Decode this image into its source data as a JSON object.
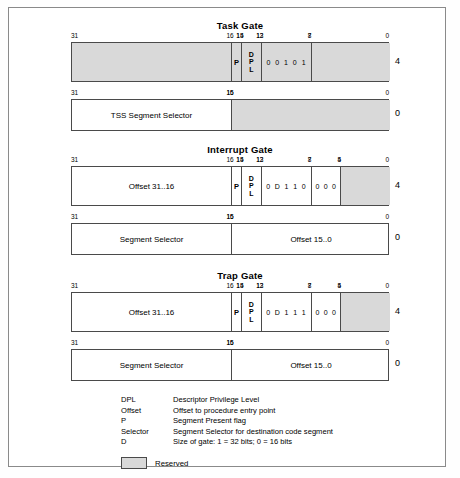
{
  "legend": {
    "rows": [
      {
        "key": "DPL",
        "desc": "Descriptor Privilege Level"
      },
      {
        "key": "Offset",
        "desc": "Offset to procedure entry point"
      },
      {
        "key": "P",
        "desc": "Segment Present flag"
      },
      {
        "key": "Selector",
        "desc": "Segment Selector for destination code segment"
      },
      {
        "key": "D",
        "desc": "Size of gate: 1 = 32 bits; 0 = 16 bits"
      }
    ],
    "reserved_label": "Reserved"
  },
  "colors": {
    "reserved_fill": "#d9d9d9",
    "box_border": "#4a4a4a",
    "page_border": "#8a8a8a",
    "background": "#ffffff"
  },
  "sections": [
    {
      "title": "Task Gate",
      "rows": [
        {
          "offset": "4",
          "ticks": [
            "31",
            "16",
            "15",
            "14",
            "13",
            "12",
            "8",
            "7",
            "0"
          ],
          "fields": [
            {
              "name": "reserved-high",
              "text": "",
              "reserved": true
            },
            {
              "name": "present-flag",
              "text": "P",
              "reserved": true
            },
            {
              "name": "dpl",
              "text": "DPL",
              "reserved": true
            },
            {
              "name": "type-bits",
              "bits": [
                "0",
                "0",
                "1",
                "0",
                "1"
              ],
              "reserved": true
            },
            {
              "name": "reserved-low",
              "text": "",
              "reserved": true
            }
          ]
        },
        {
          "offset": "0",
          "ticks": [
            "31",
            "16",
            "15",
            "0"
          ],
          "fields": [
            {
              "name": "tss-segment-selector",
              "text": "TSS Segment Selector",
              "reserved": false
            },
            {
              "name": "reserved-low",
              "text": "",
              "reserved": true
            }
          ]
        }
      ]
    },
    {
      "title": "Interrupt Gate",
      "rows": [
        {
          "offset": "4",
          "ticks": [
            "31",
            "16",
            "15",
            "14",
            "13",
            "12",
            "8",
            "7",
            "5",
            "4",
            "0"
          ],
          "fields": [
            {
              "name": "offset-high",
              "text": "Offset 31..16",
              "reserved": false
            },
            {
              "name": "present-flag",
              "text": "P",
              "reserved": false
            },
            {
              "name": "dpl",
              "text": "DPL",
              "reserved": false
            },
            {
              "name": "type-bits",
              "bits": [
                "0",
                "D",
                "1",
                "1",
                "0"
              ],
              "reserved": false
            },
            {
              "name": "zero-bits",
              "bits": [
                "0",
                "0",
                "0"
              ],
              "reserved": false
            },
            {
              "name": "reserved-low",
              "text": "",
              "reserved": true
            }
          ]
        },
        {
          "offset": "0",
          "ticks": [
            "31",
            "16",
            "15",
            "0"
          ],
          "fields": [
            {
              "name": "segment-selector",
              "text": "Segment Selector",
              "reserved": false
            },
            {
              "name": "offset-low",
              "text": "Offset 15..0",
              "reserved": false
            }
          ]
        }
      ]
    },
    {
      "title": "Trap Gate",
      "rows": [
        {
          "offset": "4",
          "ticks": [
            "31",
            "16",
            "15",
            "14",
            "13",
            "12",
            "8",
            "7",
            "5",
            "4",
            "0"
          ],
          "fields": [
            {
              "name": "offset-high",
              "text": "Offset 31..16",
              "reserved": false
            },
            {
              "name": "present-flag",
              "text": "P",
              "reserved": false
            },
            {
              "name": "dpl",
              "text": "DPL",
              "reserved": false
            },
            {
              "name": "type-bits",
              "bits": [
                "0",
                "D",
                "1",
                "1",
                "1"
              ],
              "reserved": false
            },
            {
              "name": "zero-bits",
              "bits": [
                "0",
                "0",
                "0"
              ],
              "reserved": false
            },
            {
              "name": "reserved-low",
              "text": "",
              "reserved": true
            }
          ]
        },
        {
          "offset": "0",
          "ticks": [
            "31",
            "16",
            "15",
            "0"
          ],
          "fields": [
            {
              "name": "segment-selector",
              "text": "Segment Selector",
              "reserved": false
            },
            {
              "name": "offset-low",
              "text": "Offset 15..0",
              "reserved": false
            }
          ]
        }
      ]
    }
  ]
}
